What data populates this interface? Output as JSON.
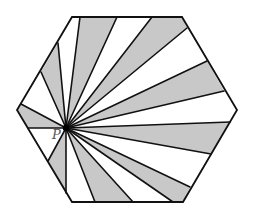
{
  "figure": {
    "type": "geometry-diagram",
    "point_label": "P",
    "colors": {
      "shaded": "#c8c8c8",
      "unshaded": "#ffffff",
      "stroke": "#111111",
      "label": "#555555"
    },
    "point_p": [
      66,
      128
    ],
    "hexagon_vertices": [
      [
        72,
        17
      ],
      [
        182,
        17
      ],
      [
        237,
        110
      ],
      [
        183,
        202
      ],
      [
        72,
        202
      ],
      [
        17,
        110
      ]
    ],
    "regions": [
      {
        "fill": "shaded",
        "points": [
          [
            66,
            128
          ],
          [
            80,
            17
          ],
          [
            117,
            17
          ]
        ]
      },
      {
        "fill": "unshaded",
        "points": [
          [
            66,
            128
          ],
          [
            117,
            17
          ],
          [
            152,
            17
          ]
        ]
      },
      {
        "fill": "shaded",
        "points": [
          [
            66,
            128
          ],
          [
            152,
            17
          ],
          [
            182,
            17
          ],
          [
            187,
            28
          ]
        ]
      },
      {
        "fill": "unshaded",
        "points": [
          [
            66,
            128
          ],
          [
            187,
            28
          ],
          [
            207,
            61
          ]
        ]
      },
      {
        "fill": "shaded",
        "points": [
          [
            66,
            128
          ],
          [
            207,
            61
          ],
          [
            224,
            91
          ]
        ]
      },
      {
        "fill": "unshaded",
        "points": [
          [
            66,
            128
          ],
          [
            224,
            91
          ],
          [
            237,
            110
          ],
          [
            230,
            122
          ]
        ]
      },
      {
        "fill": "shaded",
        "points": [
          [
            66,
            128
          ],
          [
            230,
            122
          ],
          [
            211,
            154
          ]
        ]
      },
      {
        "fill": "unshaded",
        "points": [
          [
            66,
            128
          ],
          [
            211,
            154
          ],
          [
            190,
            187
          ]
        ]
      },
      {
        "fill": "shaded",
        "points": [
          [
            66,
            128
          ],
          [
            190,
            187
          ],
          [
            183,
            202
          ],
          [
            173,
            202
          ]
        ]
      },
      {
        "fill": "unshaded",
        "points": [
          [
            66,
            128
          ],
          [
            173,
            202
          ],
          [
            133,
            202
          ]
        ]
      },
      {
        "fill": "shaded",
        "points": [
          [
            66,
            128
          ],
          [
            133,
            202
          ],
          [
            95,
            202
          ]
        ]
      },
      {
        "fill": "unshaded",
        "points": [
          [
            66,
            128
          ],
          [
            95,
            202
          ],
          [
            72,
            202
          ],
          [
            66,
            193
          ]
        ]
      },
      {
        "fill": "shaded",
        "points": [
          [
            66,
            128
          ],
          [
            66,
            193
          ],
          [
            48,
            161
          ]
        ]
      },
      {
        "fill": "unshaded",
        "points": [
          [
            66,
            128
          ],
          [
            48,
            161
          ],
          [
            28,
            128
          ]
        ]
      },
      {
        "fill": "shaded",
        "points": [
          [
            66,
            128
          ],
          [
            28,
            128
          ],
          [
            17,
            110
          ],
          [
            21,
            104
          ]
        ]
      },
      {
        "fill": "unshaded",
        "points": [
          [
            66,
            128
          ],
          [
            21,
            104
          ],
          [
            41,
            72
          ]
        ]
      },
      {
        "fill": "shaded",
        "points": [
          [
            66,
            128
          ],
          [
            41,
            72
          ],
          [
            58,
            43
          ]
        ]
      },
      {
        "fill": "unshaded",
        "points": [
          [
            66,
            128
          ],
          [
            58,
            43
          ],
          [
            72,
            17
          ],
          [
            80,
            17
          ]
        ]
      }
    ],
    "ray_endpoints": [
      [
        80,
        17
      ],
      [
        117,
        17
      ],
      [
        152,
        17
      ],
      [
        187,
        28
      ],
      [
        207,
        61
      ],
      [
        224,
        91
      ],
      [
        230,
        122
      ],
      [
        211,
        154
      ],
      [
        190,
        187
      ],
      [
        173,
        202
      ],
      [
        133,
        202
      ],
      [
        95,
        202
      ],
      [
        66,
        193
      ],
      [
        48,
        161
      ],
      [
        28,
        128
      ],
      [
        21,
        104
      ],
      [
        41,
        72
      ],
      [
        58,
        43
      ]
    ],
    "label_position": [
      52,
      139
    ]
  }
}
